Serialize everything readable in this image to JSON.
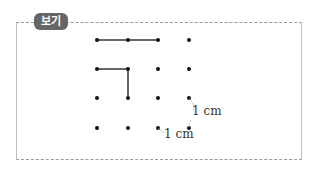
{
  "tag": {
    "label": "보기"
  },
  "grid": {
    "cols_x": [
      97,
      128,
      158,
      189
    ],
    "rows_y": [
      40,
      69,
      98,
      128
    ]
  },
  "segments": [
    {
      "from": [
        0,
        0
      ],
      "to": [
        1,
        0
      ]
    },
    {
      "from": [
        1,
        0
      ],
      "to": [
        2,
        0
      ]
    },
    {
      "from": [
        0,
        1
      ],
      "to": [
        1,
        1
      ]
    },
    {
      "from": [
        1,
        1
      ],
      "to": [
        1,
        2
      ]
    }
  ],
  "annotations": {
    "vertical": "1 cm",
    "horizontal": "1 cm"
  }
}
